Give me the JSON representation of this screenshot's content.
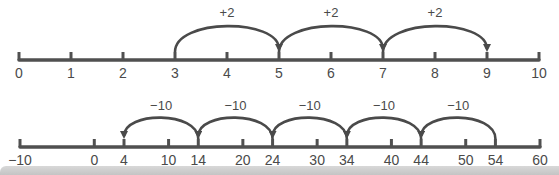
{
  "colors": {
    "line": "#505050",
    "arc": "#4a4a4a",
    "text": "#4a4a4a",
    "band": "#cccccc"
  },
  "number_lines": [
    {
      "id": "top",
      "range": [
        0,
        10
      ],
      "tick_values": [
        0,
        1,
        2,
        3,
        4,
        5,
        6,
        7,
        8,
        9,
        10
      ],
      "tick_labels": [
        "0",
        "1",
        "2",
        "3",
        "4",
        "5",
        "6",
        "7",
        "8",
        "9",
        "10"
      ],
      "jumps": [
        {
          "from": 3,
          "to": 5,
          "label": "+2"
        },
        {
          "from": 5,
          "to": 7,
          "label": "+2"
        },
        {
          "from": 7,
          "to": 9,
          "label": "+2"
        }
      ]
    },
    {
      "id": "bottom",
      "range": [
        -10,
        60
      ],
      "tick_values": [
        -10,
        0,
        4,
        10,
        14,
        20,
        24,
        30,
        34,
        40,
        44,
        50,
        54,
        60
      ],
      "tick_labels": [
        "−10",
        "0",
        "4",
        "10",
        "14",
        "20",
        "24",
        "30",
        "34",
        "40",
        "44",
        "50",
        "54",
        "60"
      ],
      "jumps": [
        {
          "from": 54,
          "to": 44,
          "label": "−10"
        },
        {
          "from": 44,
          "to": 34,
          "label": "−10"
        },
        {
          "from": 34,
          "to": 24,
          "label": "−10"
        },
        {
          "from": 24,
          "to": 14,
          "label": "−10"
        },
        {
          "from": 14,
          "to": 4,
          "label": "−10"
        }
      ]
    }
  ]
}
